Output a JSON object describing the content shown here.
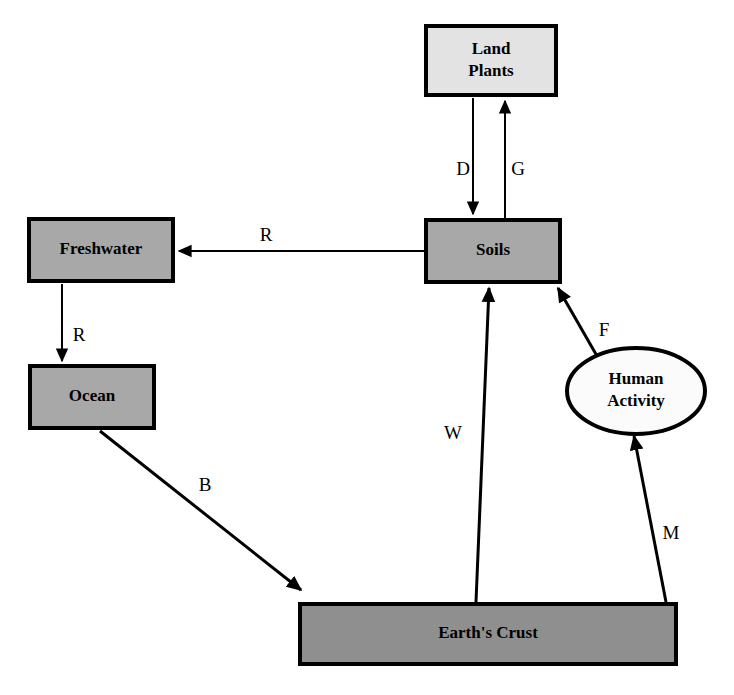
{
  "diagram": {
    "background_color": "#ffffff",
    "stroke_color": "#000000",
    "nodes": [
      {
        "id": "land-plants",
        "label_lines": [
          "Land",
          "Plants"
        ],
        "shape": "rectangle",
        "fill": "#e3e3e3",
        "x": 424,
        "y": 24,
        "width": 134,
        "height": 73,
        "border_width": 4
      },
      {
        "id": "soils",
        "label_lines": [
          "Soils"
        ],
        "shape": "rectangle",
        "fill": "#a8a8a8",
        "x": 424,
        "y": 218,
        "width": 138,
        "height": 66,
        "border_width": 4
      },
      {
        "id": "freshwater",
        "label_lines": [
          "Freshwater"
        ],
        "shape": "rectangle",
        "fill": "#a8a8a8",
        "x": 27,
        "y": 217,
        "width": 148,
        "height": 66,
        "border_width": 4
      },
      {
        "id": "ocean",
        "label_lines": [
          "Ocean"
        ],
        "shape": "rectangle",
        "fill": "#a8a8a8",
        "x": 28,
        "y": 364,
        "width": 128,
        "height": 66,
        "border_width": 4
      },
      {
        "id": "earths-crust",
        "label_lines": [
          "Earth's Crust"
        ],
        "shape": "rectangle",
        "fill": "#8f8f8f",
        "x": 298,
        "y": 602,
        "width": 380,
        "height": 64,
        "border_width": 4
      },
      {
        "id": "human-activity",
        "label_lines": [
          "Human",
          "Activity"
        ],
        "shape": "ellipse",
        "fill": "#fbfbfb",
        "cx": 636,
        "cy": 391,
        "rx": 69,
        "ry": 43,
        "border_width": 4
      }
    ],
    "edges": [
      {
        "id": "edge-d",
        "label": "D",
        "from": "land-plants",
        "to": "soils",
        "label_x": 463,
        "label_y": 171,
        "x1": 473,
        "y1": 98,
        "x2": 473,
        "y2": 214,
        "stroke_width": 2,
        "arrow": "end"
      },
      {
        "id": "edge-g",
        "label": "G",
        "from": "soils",
        "to": "land-plants",
        "label_x": 518,
        "label_y": 171,
        "x1": 505,
        "y1": 218,
        "x2": 505,
        "y2": 101,
        "stroke_width": 2,
        "arrow": "end"
      },
      {
        "id": "edge-r-soils-freshwater",
        "label": "R",
        "from": "soils",
        "to": "freshwater",
        "label_x": 266,
        "label_y": 237,
        "x1": 424,
        "y1": 251,
        "x2": 179,
        "y2": 251,
        "stroke_width": 2,
        "arrow": "end"
      },
      {
        "id": "edge-r-freshwater-ocean",
        "label": "R",
        "from": "freshwater",
        "to": "ocean",
        "label_x": 79,
        "label_y": 337,
        "x1": 62,
        "y1": 284,
        "x2": 62,
        "y2": 361,
        "stroke_width": 2,
        "arrow": "end"
      },
      {
        "id": "edge-b",
        "label": "B",
        "from": "ocean",
        "to": "earths-crust",
        "label_x": 205,
        "label_y": 487,
        "x1": 100,
        "y1": 431,
        "x2": 301,
        "y2": 590,
        "stroke_width": 3,
        "arrow": "end"
      },
      {
        "id": "edge-w",
        "label": "W",
        "from": "earths-crust",
        "to": "soils",
        "label_x": 453,
        "label_y": 435,
        "x1": 476,
        "y1": 602,
        "x2": 489,
        "y2": 288,
        "stroke_width": 3,
        "arrow": "end"
      },
      {
        "id": "edge-f",
        "label": "F",
        "from": "human-activity",
        "to": "soils",
        "label_x": 604,
        "label_y": 332,
        "x1": 597,
        "y1": 356,
        "x2": 558,
        "y2": 288,
        "stroke_width": 3,
        "arrow": "end"
      },
      {
        "id": "edge-m",
        "label": "M",
        "from": "earths-crust",
        "to": "human-activity",
        "label_x": 671,
        "label_y": 535,
        "x1": 666,
        "y1": 602,
        "x2": 634,
        "y2": 436,
        "stroke_width": 3,
        "arrow": "end"
      }
    ]
  }
}
